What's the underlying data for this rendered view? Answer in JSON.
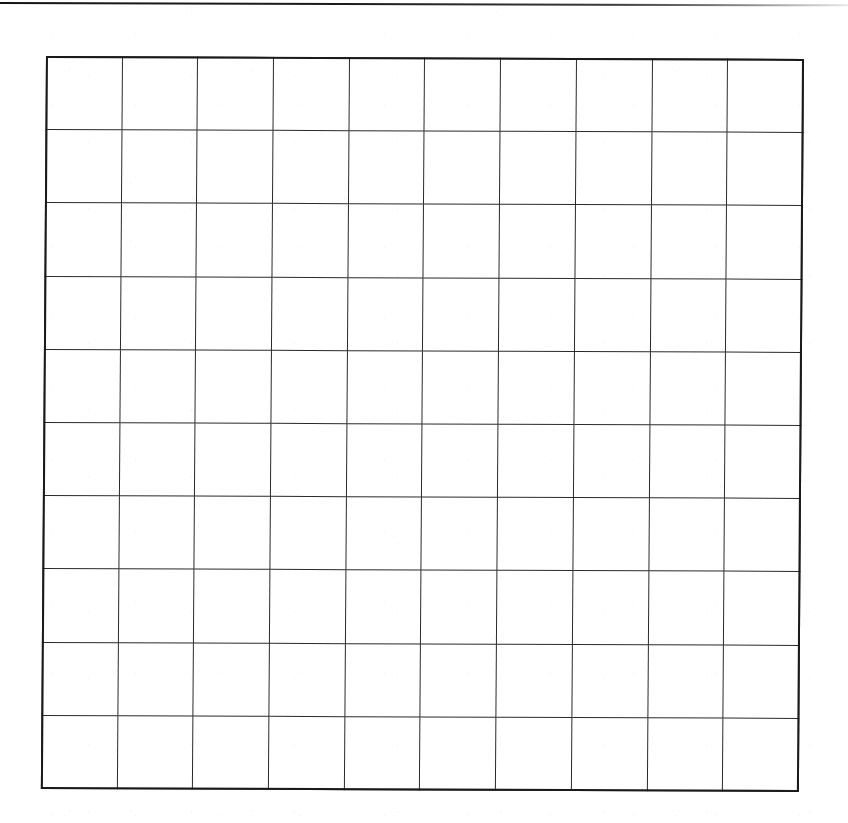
{
  "page": {
    "kind": "scanned-document-page",
    "width": 848,
    "height": 823,
    "background_color": "#ffffff",
    "ink_color": "#1a1a1a",
    "visible_text": "",
    "notes_label": ""
  },
  "header_rule": {
    "present": true,
    "label": "",
    "color": "#141414",
    "thickness_px": 2,
    "top_px": 2,
    "fades_to_right": true
  },
  "grid": {
    "label": "",
    "columns": 10,
    "rows": 10,
    "left_px": 46,
    "top_px": 56,
    "width_px": 758,
    "height_px": 733,
    "cell_width_px": 76,
    "cell_height_px": 73,
    "line_color": "#2a2a2a",
    "border_color": "#1a1a1a",
    "interior_line_px": 1.3,
    "outer_border_px": 2.4,
    "all_cells_empty": true,
    "column_headers": [
      "",
      "",
      "",
      "",
      "",
      "",
      "",
      "",
      "",
      ""
    ],
    "rows_data": [
      [
        "",
        "",
        "",
        "",
        "",
        "",
        "",
        "",
        "",
        ""
      ],
      [
        "",
        "",
        "",
        "",
        "",
        "",
        "",
        "",
        "",
        ""
      ],
      [
        "",
        "",
        "",
        "",
        "",
        "",
        "",
        "",
        "",
        ""
      ],
      [
        "",
        "",
        "",
        "",
        "",
        "",
        "",
        "",
        "",
        ""
      ],
      [
        "",
        "",
        "",
        "",
        "",
        "",
        "",
        "",
        "",
        ""
      ],
      [
        "",
        "",
        "",
        "",
        "",
        "",
        "",
        "",
        "",
        ""
      ],
      [
        "",
        "",
        "",
        "",
        "",
        "",
        "",
        "",
        "",
        ""
      ],
      [
        "",
        "",
        "",
        "",
        "",
        "",
        "",
        "",
        "",
        ""
      ],
      [
        "",
        "",
        "",
        "",
        "",
        "",
        "",
        "",
        "",
        ""
      ],
      [
        "",
        "",
        "",
        "",
        "",
        "",
        "",
        "",
        "",
        ""
      ]
    ]
  }
}
